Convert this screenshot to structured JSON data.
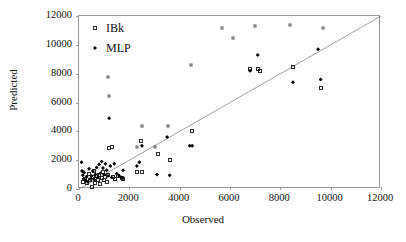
{
  "chart_data": {
    "type": "scatter",
    "title": "",
    "xlabel": "Observed",
    "ylabel": "Predicted",
    "xlim": [
      0,
      12000
    ],
    "ylim": [
      0,
      12000
    ],
    "xticks": [
      0,
      2000,
      4000,
      6000,
      8000,
      10000,
      12000
    ],
    "yticks": [
      0,
      2000,
      4000,
      6000,
      8000,
      10000,
      12000
    ],
    "xtick_labels": [
      "0",
      "2000",
      "4000",
      "6000",
      "8000",
      "10000",
      "12000"
    ],
    "ytick_labels": [
      "0",
      "2000",
      "4000",
      "6000",
      "8000",
      "10000",
      "12000"
    ],
    "grid": false,
    "legend_position": "top-left",
    "reference_line": {
      "name": "1:1 line",
      "from": [
        0,
        0
      ],
      "to": [
        12000,
        12000
      ],
      "color": "#888888"
    },
    "series": [
      {
        "name": "IBk",
        "marker": "open-square",
        "color": "#2a2a2a",
        "points": [
          [
            150,
            500
          ],
          [
            250,
            700
          ],
          [
            300,
            400
          ],
          [
            400,
            1050
          ],
          [
            450,
            600
          ],
          [
            500,
            150
          ],
          [
            550,
            800
          ],
          [
            600,
            1250
          ],
          [
            620,
            700
          ],
          [
            650,
            450
          ],
          [
            700,
            900
          ],
          [
            750,
            600
          ],
          [
            800,
            1000
          ],
          [
            850,
            350
          ],
          [
            900,
            750
          ],
          [
            950,
            1150
          ],
          [
            1000,
            600
          ],
          [
            1050,
            850
          ],
          [
            1100,
            500
          ],
          [
            1150,
            1000
          ],
          [
            1200,
            2850
          ],
          [
            1300,
            2900
          ],
          [
            1350,
            800
          ],
          [
            1450,
            700
          ],
          [
            1550,
            900
          ],
          [
            1700,
            750
          ],
          [
            1750,
            700
          ],
          [
            2300,
            1150
          ],
          [
            2450,
            3300
          ],
          [
            2500,
            1200
          ],
          [
            3150,
            2400
          ],
          [
            3600,
            2000
          ],
          [
            4500,
            4000
          ],
          [
            6800,
            8350
          ],
          [
            7100,
            8300
          ],
          [
            7200,
            8200
          ],
          [
            8500,
            8450
          ],
          [
            9600,
            7000
          ]
        ]
      },
      {
        "name": "MLP",
        "marker": "filled-diamond",
        "color": "#000000",
        "points": [
          [
            100,
            1850
          ],
          [
            120,
            1250
          ],
          [
            150,
            950
          ],
          [
            180,
            700
          ],
          [
            200,
            1150
          ],
          [
            250,
            600
          ],
          [
            300,
            850
          ],
          [
            350,
            500
          ],
          [
            400,
            1400
          ],
          [
            450,
            700
          ],
          [
            500,
            900
          ],
          [
            550,
            1250
          ],
          [
            600,
            650
          ],
          [
            650,
            1000
          ],
          [
            700,
            1500
          ],
          [
            750,
            800
          ],
          [
            800,
            1700
          ],
          [
            850,
            1100
          ],
          [
            900,
            1900
          ],
          [
            950,
            1450
          ],
          [
            1000,
            1000
          ],
          [
            1050,
            1750
          ],
          [
            1100,
            1300
          ],
          [
            1150,
            900
          ],
          [
            1200,
            4900
          ],
          [
            1250,
            1600
          ],
          [
            1300,
            800
          ],
          [
            1400,
            1750
          ],
          [
            1500,
            1050
          ],
          [
            1600,
            900
          ],
          [
            1700,
            800
          ],
          [
            1750,
            1300
          ],
          [
            2300,
            1600
          ],
          [
            2400,
            1850
          ],
          [
            2500,
            3000
          ],
          [
            3100,
            1000
          ],
          [
            3500,
            3600
          ],
          [
            3600,
            950
          ],
          [
            4400,
            3000
          ],
          [
            4500,
            3000
          ],
          [
            6800,
            8200
          ],
          [
            7100,
            9300
          ],
          [
            8500,
            7400
          ],
          [
            9500,
            9700
          ],
          [
            9600,
            7600
          ]
        ]
      },
      {
        "name": "IBk-small",
        "marker": "open-square",
        "color": "#5a5a5a",
        "points": [
          [
            1150,
            7800
          ],
          [
            1200,
            6450
          ],
          [
            2500,
            4350
          ],
          [
            3550,
            4350
          ],
          [
            4450,
            8600
          ],
          [
            2300,
            2900
          ],
          [
            3000,
            2900
          ],
          [
            5700,
            11200
          ],
          [
            7000,
            11300
          ],
          [
            6100,
            10500
          ],
          [
            8400,
            11400
          ],
          [
            9700,
            11200
          ]
        ]
      }
    ]
  },
  "legend": {
    "items": [
      {
        "label": "IBk",
        "marker": "open-square"
      },
      {
        "label": "MLP",
        "marker": "filled-diamond"
      }
    ]
  },
  "axes": {
    "x_title": "Observed",
    "y_title": "Predicted"
  }
}
